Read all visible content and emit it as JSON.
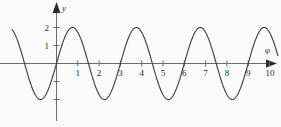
{
  "chart_data": {
    "type": "line",
    "title": "",
    "xlabel": "φ",
    "ylabel": "y",
    "function": "y = 2 sin(2πφ/3)",
    "amplitude": 2,
    "period": 3,
    "xlim": [
      -2.1,
      10.4
    ],
    "ylim": [
      -2.4,
      2.4
    ],
    "grid": false,
    "legend": null,
    "x_ticks": [
      1,
      2,
      3,
      4,
      5,
      6,
      7,
      8,
      9,
      10
    ],
    "x_tick_labels": [
      "1",
      "2",
      "3",
      "4",
      "5",
      "6",
      "7",
      "8",
      "9",
      "10"
    ],
    "y_ticks": [
      1,
      2
    ],
    "y_tick_labels": [
      "1",
      "2"
    ],
    "y_unlabeled_ticks": [
      -1,
      -2
    ],
    "x": [
      -2.1,
      -2.0,
      -1.9,
      -1.8,
      -1.7,
      -1.6,
      -1.5,
      -1.4,
      -1.3,
      -1.2,
      -1.1,
      -1.0,
      -0.9,
      -0.8,
      -0.7,
      -0.6,
      -0.5,
      -0.4,
      -0.3,
      -0.2,
      -0.1,
      0.0,
      0.1,
      0.2,
      0.3,
      0.4,
      0.5,
      0.6,
      0.7,
      0.8,
      0.9,
      1.0,
      1.1,
      1.2,
      1.3,
      1.4,
      1.5,
      1.6,
      1.7,
      1.8,
      1.9,
      2.0,
      2.1,
      2.2,
      2.3,
      2.4,
      2.5,
      2.6,
      2.7,
      2.8,
      2.9,
      3.0,
      3.1,
      3.2,
      3.3,
      3.4,
      3.5,
      3.6,
      3.7,
      3.8,
      3.9,
      4.0,
      4.1,
      4.2,
      4.3,
      4.4,
      4.5,
      4.6,
      4.7,
      4.8,
      4.9,
      5.0,
      5.1,
      5.2,
      5.3,
      5.4,
      5.5,
      5.6,
      5.7,
      5.8,
      5.9,
      6.0,
      6.1,
      6.2,
      6.3,
      6.4,
      6.5,
      6.6,
      6.7,
      6.8,
      6.9,
      7.0,
      7.1,
      7.2,
      7.3,
      7.4,
      7.5,
      7.6,
      7.7,
      7.8,
      7.9,
      8.0,
      8.1,
      8.2,
      8.3,
      8.4,
      8.5,
      8.6,
      8.7,
      8.8,
      8.9,
      9.0,
      9.1,
      9.2,
      9.3,
      9.4,
      9.5,
      9.6,
      9.7,
      9.8,
      9.9,
      10.0
    ],
    "y": [
      -1.0,
      -1.41,
      -1.73,
      -1.93,
      -2.0,
      -1.93,
      -1.73,
      -1.41,
      -1.0,
      -0.52,
      0.0,
      0.52,
      1.0,
      1.41,
      1.73,
      1.93,
      2.0,
      1.93,
      1.73,
      1.41,
      1.0,
      0.0,
      0.41,
      0.81,
      1.18,
      1.5,
      1.73,
      1.9,
      1.99,
      1.99,
      1.9,
      1.73,
      1.5,
      1.18,
      0.81,
      0.41,
      0.0,
      -0.41,
      -0.81,
      -1.18,
      -1.5,
      -1.73,
      -1.9,
      -1.99,
      -1.99,
      -1.9,
      -1.73,
      -1.5,
      -1.18,
      -0.81,
      -0.41,
      0.0,
      0.41,
      0.81,
      1.18,
      1.5,
      1.73,
      1.9,
      1.99,
      1.99,
      1.9,
      1.73,
      1.5,
      1.18,
      0.81,
      0.41,
      0.0,
      -0.41,
      -0.81,
      -1.18,
      -1.5,
      -1.73,
      -1.9,
      -1.99,
      -1.99,
      -1.9,
      -1.73,
      -1.5,
      -1.18,
      -0.81,
      -0.41,
      0.0,
      0.41,
      0.81,
      1.18,
      1.5,
      1.73,
      1.9,
      1.99,
      1.99,
      1.9,
      1.73,
      1.5,
      1.18,
      0.81,
      0.41,
      0.0,
      -0.41,
      -0.81,
      -1.18,
      -1.5,
      -1.73,
      -1.9,
      -1.99,
      -1.99,
      -1.9,
      -1.73,
      -1.5,
      -1.18,
      -0.81,
      -0.41,
      0.0,
      0.41,
      0.81,
      1.18,
      1.5,
      1.73,
      1.9,
      1.99,
      1.99,
      1.9,
      1.73
    ],
    "maxima": [
      {
        "x": 1,
        "y": 2
      },
      {
        "x": 4,
        "y": 2
      },
      {
        "x": 7,
        "y": 2
      }
    ],
    "minima": [
      {
        "x": 2.5,
        "y": -2
      },
      {
        "x": 5.5,
        "y": -2
      },
      {
        "x": 8.5,
        "y": -2
      }
    ],
    "zero_crossings": [
      0,
      1.5,
      3,
      4.5,
      6,
      7.5,
      9
    ],
    "colors": {
      "curve": "#3a3a3a",
      "axis": "#6b6b6b",
      "text": "#2a2a2a",
      "background": "#fbfbfb"
    }
  },
  "axes": {
    "x_axis_name": "φ",
    "y_axis_name": "y"
  }
}
